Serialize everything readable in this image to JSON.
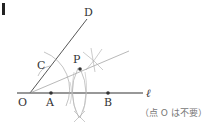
{
  "figure": {
    "labels": {
      "O": "O",
      "A": "A",
      "B": "B",
      "C": "C",
      "D": "D",
      "P": "P",
      "line": "ℓ"
    },
    "note": "（点 O は不要）",
    "colors": {
      "ink": "#333333",
      "construction": "#aaaaaa",
      "point": "#333333",
      "marker": "#222222"
    }
  }
}
